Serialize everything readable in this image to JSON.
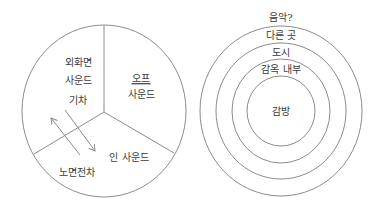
{
  "diagram_left": {
    "type": "pie-divided-circle",
    "center": [
      104,
      111
    ],
    "radius_x": 82,
    "radius_y": 86,
    "stroke_color": "#8c8c8c",
    "sectors": [
      {
        "id": "offscreen",
        "lines": [
          "외화면",
          "사운드"
        ]
      },
      {
        "id": "off",
        "lines": [
          "오프",
          "사운드"
        ],
        "underlined_word": "오프"
      },
      {
        "id": "in",
        "lines": [
          "인 사운드"
        ]
      }
    ],
    "labels": {
      "offscreen_line1": "외화면",
      "offscreen_line2": "사운드",
      "train": "기차",
      "off_line1": "오프",
      "off_line2": "사운드",
      "in_sound": "인 사운드",
      "tram": "노면전차"
    },
    "arrows": [
      {
        "from": "노면전차",
        "to": "외화면 사운드",
        "direction": "up-left"
      },
      {
        "from": "기차",
        "to": "인 사운드",
        "direction": "down-right"
      }
    ]
  },
  "diagram_right": {
    "type": "concentric-circles",
    "center": [
      281,
      111
    ],
    "stroke_color": "#8c8c8c",
    "rings": [
      {
        "label": "음악?",
        "rx": null,
        "ry": null
      },
      {
        "label": "다른 곳",
        "rx": 81,
        "ry": 85
      },
      {
        "label": "도시",
        "rx": 65,
        "ry": 68
      },
      {
        "label": "감옥 내부",
        "rx": 49,
        "ry": 52
      },
      {
        "label": "감방",
        "rx": 34,
        "ry": 35
      }
    ],
    "labels": {
      "music": "음악?",
      "elsewhere": "다른 곳",
      "city": "도시",
      "prison_inside": "감옥 내부",
      "cell": "감방"
    }
  }
}
